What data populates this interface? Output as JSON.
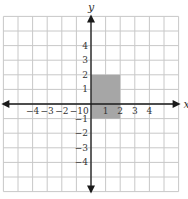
{
  "diagram": {
    "type": "coordinate-plane",
    "x_axis_label": "x",
    "y_axis_label": "y",
    "origin_label": "0",
    "x_tick_labels": [
      {
        "value": -4,
        "label": "−4"
      },
      {
        "value": -3,
        "label": "−3"
      },
      {
        "value": -2,
        "label": "−2"
      },
      {
        "value": -1,
        "label": "−1"
      },
      {
        "value": 1,
        "label": "1"
      },
      {
        "value": 2,
        "label": "2"
      },
      {
        "value": 3,
        "label": "3"
      },
      {
        "value": 4,
        "label": "4"
      }
    ],
    "y_tick_labels": [
      {
        "value": 4,
        "label": "4"
      },
      {
        "value": 3,
        "label": "3"
      },
      {
        "value": 2,
        "label": "2"
      },
      {
        "value": 1,
        "label": "1"
      },
      {
        "value": -1,
        "label": "−1"
      },
      {
        "value": -2,
        "label": "−2"
      },
      {
        "value": -3,
        "label": "−3"
      },
      {
        "value": -4,
        "label": "−4"
      }
    ],
    "grid_range": {
      "x_min": -6,
      "x_max": 6,
      "y_min": -6,
      "y_max": 6
    },
    "shaded_rectangle": {
      "x_min": 0,
      "x_max": 2,
      "y_min": -1,
      "y_max": 2,
      "fill": "#a6a6a6"
    },
    "colors": {
      "grid_line": "#c8c8c8",
      "axis": "#1a1a1a",
      "label": "#333333",
      "background": "#ffffff"
    }
  }
}
